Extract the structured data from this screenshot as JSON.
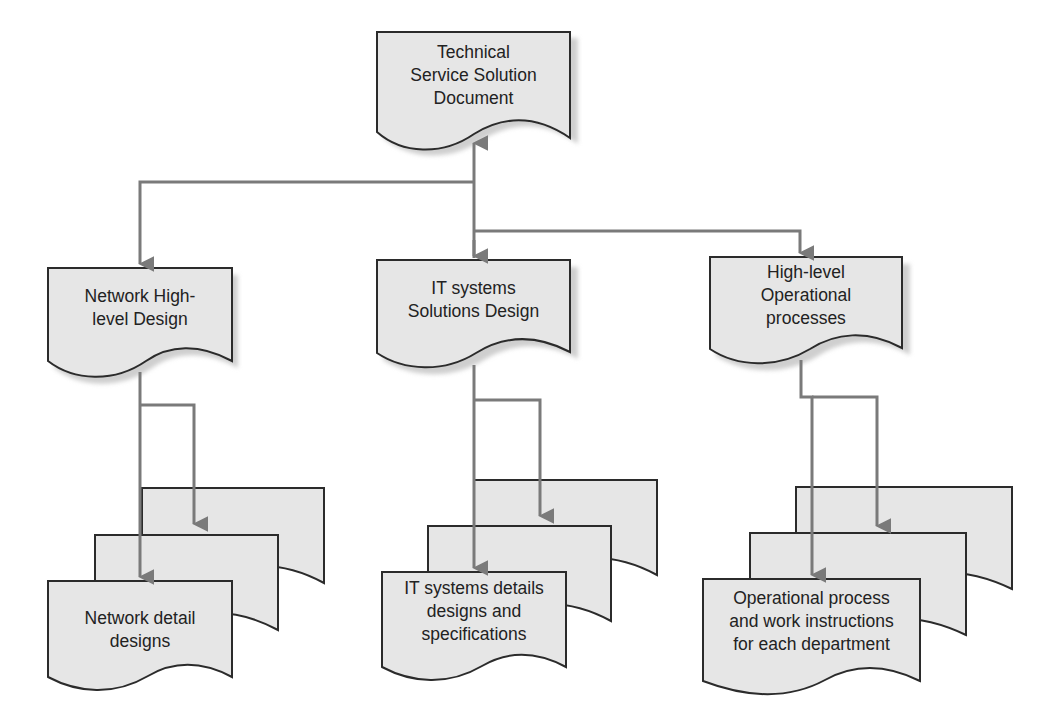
{
  "diagram": {
    "colors": {
      "doc_fill": "#e6e6e6",
      "doc_stroke": "#2b2b2b",
      "shadow": "#cfcfcf",
      "connector": "#7a7a7a",
      "text": "#222222"
    },
    "top": {
      "label_lines": [
        "Technical",
        "Service Solution",
        "Document"
      ]
    },
    "level2": [
      {
        "id": "network-high-level-design",
        "label_lines": [
          "Network High-",
          "level Design"
        ]
      },
      {
        "id": "it-systems-solutions-design",
        "label_lines": [
          "IT systems",
          "Solutions Design"
        ]
      },
      {
        "id": "high-level-operational-processes",
        "label_lines": [
          "High-level",
          "Operational",
          "processes"
        ]
      }
    ],
    "level3": [
      {
        "id": "network-detail-designs",
        "label_lines": [
          "Network detail",
          "designs"
        ],
        "stack_count": 3
      },
      {
        "id": "it-systems-details-designs",
        "label_lines": [
          "IT systems details",
          "designs and",
          "specifications"
        ],
        "stack_count": 3
      },
      {
        "id": "operational-process-work-instructions",
        "label_lines": [
          "Operational process",
          "and work instructions",
          "for each department"
        ],
        "stack_count": 3
      }
    ]
  }
}
